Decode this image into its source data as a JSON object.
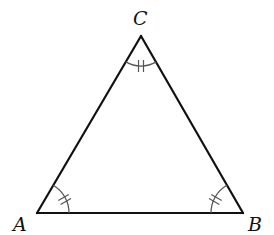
{
  "figure": {
    "type": "equilateral-triangle",
    "vertices": [
      {
        "id": "A",
        "label": "A",
        "x": 37,
        "y": 213
      },
      {
        "id": "B",
        "label": "B",
        "x": 243,
        "y": 213
      },
      {
        "id": "C",
        "label": "C",
        "x": 141,
        "y": 36
      }
    ],
    "sides": [
      {
        "from": "A",
        "to": "B"
      },
      {
        "from": "B",
        "to": "C"
      },
      {
        "from": "C",
        "to": "A"
      }
    ],
    "angle_marks": [
      {
        "vertex": "A",
        "arcs": 1,
        "ticks": 2
      },
      {
        "vertex": "B",
        "arcs": 1,
        "ticks": 2
      },
      {
        "vertex": "C",
        "arcs": 1,
        "ticks": 2
      }
    ],
    "colors": {
      "edge": "#111111",
      "angle_mark": "#555555",
      "label": "#111111",
      "background": "#ffffff"
    }
  },
  "labels": {
    "A": "A",
    "B": "B",
    "C": "C"
  }
}
